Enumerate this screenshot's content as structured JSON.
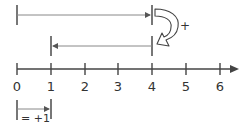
{
  "diagram": {
    "title": "",
    "colors": {
      "line": "#666666",
      "axis": "#444444",
      "text": "#333333",
      "arrow_outline": "#444444",
      "arrow_fill": "#ffffff"
    },
    "number_line": {
      "ticks": [
        "0",
        "1",
        "2",
        "3",
        "4",
        "5",
        "6"
      ],
      "has_arrow_right": true
    },
    "top_arrow": {
      "from": 0,
      "to": 4,
      "direction": "right"
    },
    "middle_arrow": {
      "from": 4,
      "to": 1,
      "direction": "left"
    },
    "curved_arrow": {
      "label": "+"
    },
    "unit_legend": {
      "from": 0,
      "to": 1,
      "label": "= +1"
    }
  }
}
